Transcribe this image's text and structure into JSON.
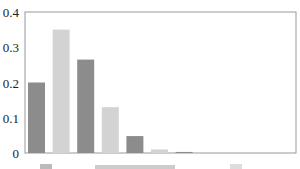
{
  "chart_data": {
    "type": "bar",
    "title": "",
    "xlabel": "",
    "ylabel": "",
    "categories": [
      "1",
      "2",
      "3",
      "4",
      "5",
      "6",
      "7",
      "8",
      "9",
      "10"
    ],
    "values": [
      0.2,
      0.35,
      0.265,
      0.13,
      0.048,
      0.01,
      0.003,
      0,
      0,
      0
    ],
    "ylim": [
      0,
      0.4
    ],
    "yticks": [
      "0",
      "0.1",
      "0.2",
      "0.3",
      "0.4"
    ],
    "grid": false,
    "legend_position": "bottom (cut off)",
    "colors": [
      "#8c8c8c",
      "#d3d3d3"
    ]
  }
}
